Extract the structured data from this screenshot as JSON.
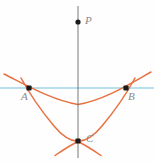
{
  "figure": {
    "width": 154,
    "height": 162,
    "background_color": "#fefefe",
    "colors": {
      "curve": "#e8713f",
      "horizontal_line": "#9fd4e8",
      "axis_line": "#6b6b6b",
      "point_fill": "#1a1a1a",
      "label_text": "#8a8a8a"
    },
    "points": [
      {
        "id": "P",
        "label": "P",
        "x": 78,
        "y": 22,
        "label_x": 85,
        "label_y": 16
      },
      {
        "id": "A",
        "label": "A",
        "x": 29,
        "y": 88,
        "label_x": 22,
        "label_y": 92
      },
      {
        "id": "B",
        "label": "B",
        "x": 126,
        "y": 88,
        "label_x": 128,
        "label_y": 92
      },
      {
        "id": "C",
        "label": "C",
        "x": 78,
        "y": 141,
        "label_x": 85,
        "label_y": 134
      }
    ],
    "lines": [
      {
        "id": "vertical-axis",
        "name": "axis-of-symmetry",
        "x1": 78,
        "y1": 6,
        "x2": 78,
        "y2": 158,
        "color": "#6b6b6b",
        "width": 1
      },
      {
        "id": "horizontal-chord",
        "name": "chord-through-A-and-B",
        "x1": 0,
        "y1": 88,
        "x2": 154,
        "y2": 88,
        "color": "#9fd4e8",
        "width": 1.6
      }
    ],
    "curves": [
      {
        "id": "wide-parabola",
        "name": "shallow-parabola-through-A-B",
        "color": "#e8713f",
        "width": 1.5,
        "vertex": {
          "x": 78,
          "y": 105
        },
        "path": "M 4,74 Q 41,94 78,105 Q 115,94 151,73"
      },
      {
        "id": "narrow-parabola",
        "name": "steep-parabola-through-A-C-B",
        "color": "#e8713f",
        "width": 1.5,
        "vertex": {
          "x": 78,
          "y": 141
        },
        "path": "M 22,80 Q 28,88 44,112 Q 62,139 78,141 Q 94,139 112,112 Q 128,88 134,80"
      },
      {
        "id": "narrow-parabola-tail-left",
        "name": "steep-parabola-lower-left-tail",
        "color": "#e8713f",
        "width": 1.5,
        "path": "M 78,141 Q 88,146 101,155"
      },
      {
        "id": "narrow-parabola-tail-right",
        "name": "steep-parabola-lower-right-tail",
        "color": "#e8713f",
        "width": 1.5,
        "path": "M 78,141 Q 68,146 55,155"
      }
    ]
  }
}
